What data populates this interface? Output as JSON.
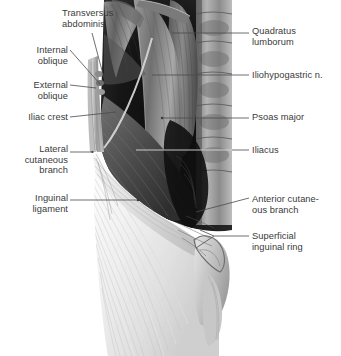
{
  "figure": {
    "style": "grayscale anatomical illustration",
    "background": "#ffffff",
    "text_color": "#3a3a3a",
    "leader_color": "#4a4a4a"
  },
  "labels_left": [
    {
      "id": "transversus-abdominis",
      "text": "Transversus\nabdominis",
      "align": "left",
      "x": 62,
      "y": 8
    },
    {
      "id": "internal-oblique",
      "text": "Internal\noblique",
      "align": "right",
      "x": 0,
      "y": 45,
      "w": 68
    },
    {
      "id": "external-oblique",
      "text": "External\noblique",
      "align": "right",
      "x": 0,
      "y": 80,
      "w": 68
    },
    {
      "id": "iliac-crest",
      "text": "Iliac crest",
      "align": "right",
      "x": 0,
      "y": 112,
      "w": 68
    },
    {
      "id": "lateral-cutaneous-branch",
      "text": "Lateral\ncutaneous\nbranch",
      "align": "right",
      "x": 0,
      "y": 144,
      "w": 68
    },
    {
      "id": "inguinal-ligament",
      "text": "Inguinal\nligament",
      "align": "right",
      "x": 0,
      "y": 193,
      "w": 68
    }
  ],
  "labels_right": [
    {
      "id": "quadratus-lumborum",
      "text": "Quadratus\nlumborum",
      "align": "left",
      "x": 252,
      "y": 26
    },
    {
      "id": "iliohypogastric-nerve",
      "text": "Iliohypogastric n.",
      "align": "left",
      "x": 252,
      "y": 70
    },
    {
      "id": "psoas-major",
      "text": "Psoas major",
      "align": "left",
      "x": 252,
      "y": 112
    },
    {
      "id": "iliacus",
      "text": "Iliacus",
      "align": "left",
      "x": 252,
      "y": 145
    },
    {
      "id": "anterior-cutaneous-branch",
      "text": "Anterior cutane-\nous branch",
      "align": "left",
      "x": 252,
      "y": 194
    },
    {
      "id": "superficial-inguinal-ring",
      "text": "Superficial\ninguinal ring",
      "align": "left",
      "x": 252,
      "y": 231
    }
  ],
  "structures": [
    "transversus abdominis",
    "internal oblique",
    "external oblique aponeurosis",
    "iliac crest",
    "lateral cutaneous branch",
    "inguinal ligament",
    "quadratus lumborum",
    "iliohypogastric nerve",
    "psoas major",
    "iliacus",
    "anterior cutaneous branch",
    "superficial inguinal ring"
  ]
}
